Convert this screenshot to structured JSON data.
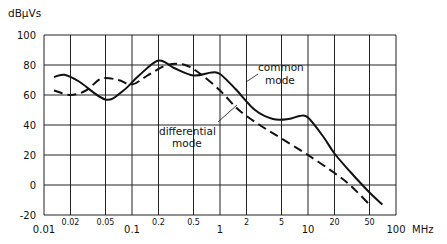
{
  "chart_data": {
    "type": "line",
    "title": "",
    "ylabel": "dBµVs",
    "xlabel": "MHz",
    "xscale": "log",
    "xlim": [
      0.01,
      100
    ],
    "ylim": [
      -20,
      100
    ],
    "grid": true,
    "y_ticks": [
      "100",
      "80",
      "60",
      "40",
      "20",
      "0",
      "-20"
    ],
    "x_ticks_major": [
      "0.01",
      "0.1",
      "1",
      "10",
      "100"
    ],
    "x_ticks_minor": [
      "0.02",
      "0.05",
      "0.2",
      "0.5",
      "2",
      "5",
      "20",
      "50"
    ],
    "x_unit": "MHz",
    "series": [
      {
        "name": "common mode",
        "style": "solid",
        "x": [
          0.013,
          0.017,
          0.025,
          0.05,
          0.08,
          0.12,
          0.2,
          0.3,
          0.5,
          0.8,
          1.0,
          1.5,
          2.5,
          4,
          6,
          8,
          10,
          15,
          20,
          30,
          50,
          70
        ],
        "values": [
          72,
          73.5,
          69,
          57,
          63,
          73,
          83,
          78,
          73,
          75,
          74,
          64,
          50,
          44,
          44,
          46,
          45,
          32,
          21,
          9,
          -5,
          -13
        ]
      },
      {
        "name": "differential mode",
        "style": "dashed",
        "x": [
          0.013,
          0.02,
          0.03,
          0.045,
          0.07,
          0.1,
          0.15,
          0.25,
          0.4,
          0.6,
          1.0,
          1.5,
          2,
          3,
          5,
          10,
          20,
          30,
          50
        ],
        "values": [
          63,
          60,
          63,
          71,
          70,
          67,
          73,
          80,
          80,
          74,
          63,
          52,
          46,
          39,
          31,
          20,
          8,
          0,
          -13
        ]
      }
    ],
    "annotations": [
      {
        "text": "common\nmode",
        "series": "common mode"
      },
      {
        "text": "differential\nmode",
        "series": "differential mode"
      }
    ]
  },
  "labels": {
    "ylabel": "dBµVs",
    "xunit": "MHz",
    "common_line1": "common",
    "common_line2": "mode",
    "diff_line1": "differential",
    "diff_line2": "mode"
  }
}
